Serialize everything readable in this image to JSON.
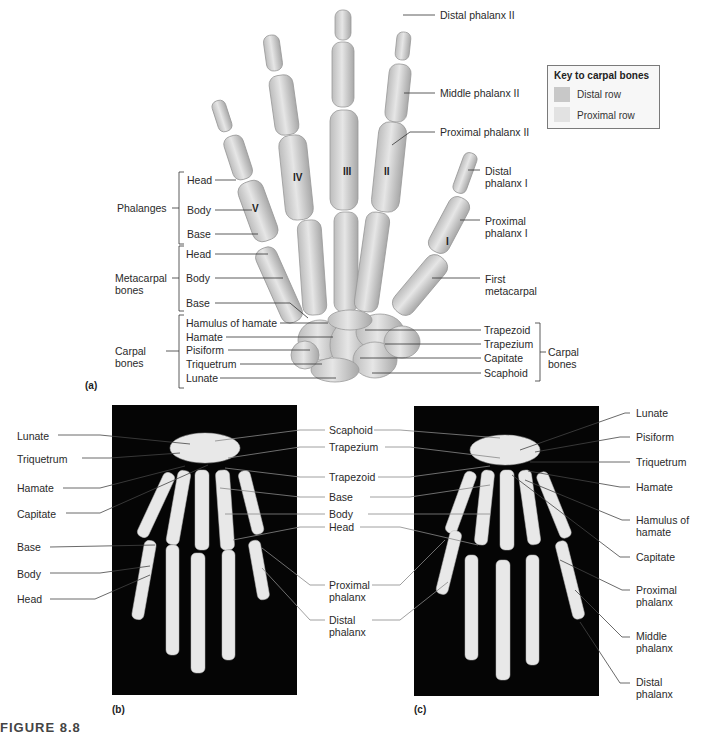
{
  "figure": {
    "caption_partial": "FIGURE 8.8",
    "panels": [
      "(a)",
      "(b)",
      "(c)"
    ]
  },
  "key": {
    "title": "Key to carpal bones",
    "items": [
      {
        "label": "Distal row",
        "color": "#c8c8c8"
      },
      {
        "label": "Proximal row",
        "color": "#e2e2e2"
      }
    ]
  },
  "panel_a": {
    "roman_numerals": [
      "I",
      "II",
      "III",
      "IV",
      "V"
    ],
    "right_labels": {
      "distal_phalanx_ii": "Distal phalanx II",
      "middle_phalanx_ii": "Middle phalanx II",
      "proximal_phalanx_ii": "Proximal phalanx II",
      "distal_phalanx_i": "Distal phalanx I",
      "proximal_phalanx_i": "Proximal phalanx I",
      "first_metacarpal": "First metacarpal",
      "trapezoid": "Trapezoid",
      "trapezium": "Trapezium",
      "capitate": "Capitate",
      "scaphoid": "Scaphoid",
      "carpal_bones": "Carpal bones"
    },
    "left_groups": {
      "phalanges": {
        "group": "Phalanges",
        "items": [
          "Head",
          "Body",
          "Base"
        ]
      },
      "metacarpals": {
        "group": "Metacarpal bones",
        "items": [
          "Head",
          "Body",
          "Base"
        ]
      },
      "carpals": {
        "group": "Carpal bones",
        "items": [
          "Hamulus of hamate",
          "Hamate",
          "Pisiform",
          "Triquetrum",
          "Lunate"
        ]
      }
    }
  },
  "panel_b": {
    "left_labels": [
      "Lunate",
      "Triquetrum",
      "Hamate",
      "Capitate",
      "Base",
      "Body",
      "Head"
    ],
    "center_labels": [
      "Scaphoid",
      "Trapezium",
      "Trapezoid",
      "Base",
      "Body",
      "Head",
      "Proximal phalanx",
      "Distal phalanx"
    ]
  },
  "panel_c": {
    "right_labels": [
      "Lunate",
      "Pisiform",
      "Triquetrum",
      "Hamate",
      "Hamulus of hamate",
      "Capitate",
      "Proximal phalanx",
      "Middle phalanx",
      "Distal phalanx"
    ]
  },
  "colors": {
    "bone": "#d9d9d9",
    "bone_shadow": "#a9a9a9",
    "xray_bg": "#050505",
    "leader": "#333333"
  }
}
